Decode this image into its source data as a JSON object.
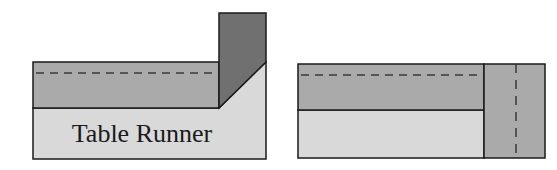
{
  "diagram": {
    "colors": {
      "light": "#d9d9d9",
      "mid": "#aaaaaa",
      "dark": "#707070",
      "stroke": "#1a1a1a",
      "dash": "#3a3a3a"
    },
    "left_figure": {
      "label": "Table Runner",
      "parts": [
        "table-runner-base",
        "folded-band",
        "folded-corner-flap",
        "fold-line-dashed"
      ]
    },
    "right_figure": {
      "parts": [
        "runner-base",
        "folded-band",
        "end-strip",
        "horizontal-fold-line-dashed",
        "vertical-fold-line-dashed"
      ]
    }
  }
}
